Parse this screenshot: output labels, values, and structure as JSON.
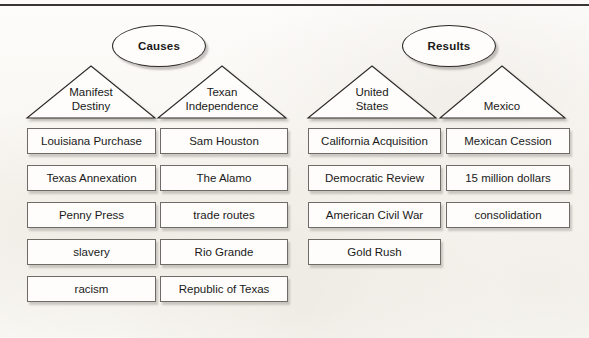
{
  "figure": {
    "top_rule_color": "#3a3733",
    "background_color": "#fbfaf7",
    "box_border_color": "#6e6b66",
    "line_color": "#2b2926"
  },
  "groups": [
    {
      "id": "causes",
      "bubble_label": "Causes",
      "columns": [
        {
          "id": "manifest-destiny",
          "triangle_label_line1": "Manifest",
          "triangle_label_line2": "Destiny",
          "items": [
            "Louisiana Purchase",
            "Texas Annexation",
            "Penny Press",
            "slavery",
            "racism"
          ]
        },
        {
          "id": "texan-independence",
          "triangle_label_line1": "Texan",
          "triangle_label_line2": "Independence",
          "items": [
            "Sam Houston",
            "The Alamo",
            "trade routes",
            "Rio Grande",
            "Republic of Texas"
          ]
        }
      ]
    },
    {
      "id": "results",
      "bubble_label": "Results",
      "columns": [
        {
          "id": "united-states",
          "triangle_label_line1": "United",
          "triangle_label_line2": "States",
          "items": [
            "California Acquisition",
            "Democratic Review",
            "American Civil War",
            "Gold Rush"
          ]
        },
        {
          "id": "mexico",
          "triangle_label_line1": "Mexico",
          "triangle_label_line2": "",
          "items": [
            "Mexican Cession",
            "15 million dollars",
            "consolidation"
          ]
        }
      ]
    }
  ]
}
